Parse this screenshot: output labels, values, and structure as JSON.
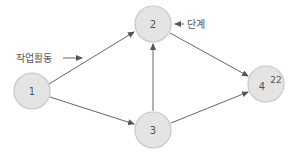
{
  "diagram": {
    "type": "network-activity-diagram",
    "nodes": [
      {
        "id": "1",
        "label": "1",
        "cx": 32,
        "cy": 91
      },
      {
        "id": "2",
        "label": "2",
        "cx": 153,
        "cy": 24
      },
      {
        "id": "3",
        "label": "3",
        "cx": 153,
        "cy": 130
      },
      {
        "id": "4",
        "label": "4",
        "cx": 266,
        "cy": 84,
        "superscript": "22"
      }
    ],
    "edges": [
      {
        "from": "1",
        "to": "2"
      },
      {
        "from": "1",
        "to": "3"
      },
      {
        "from": "3",
        "to": "2"
      },
      {
        "from": "2",
        "to": "4"
      },
      {
        "from": "3",
        "to": "4"
      }
    ],
    "annotations": {
      "activity_label": "작업활동",
      "stage_label": "단계"
    },
    "colors": {
      "node_fill": "#e4e4e4",
      "node_stroke": "#c8c8c8",
      "edge": "#555555",
      "text": "#555555"
    }
  }
}
